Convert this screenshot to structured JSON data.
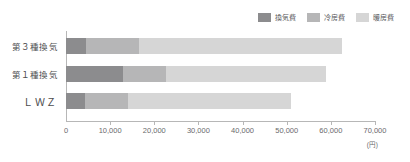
{
  "chart_data": {
    "type": "bar",
    "orientation": "horizontal",
    "stacked": true,
    "title": "",
    "xlabel": "(円)",
    "ylabel": "",
    "xlim": [
      0,
      70000
    ],
    "grid": false,
    "legend_position": "top-right",
    "categories": [
      "第３種換気",
      "第１種換気",
      "ＬＷＺ"
    ],
    "tick_labels": [
      "0",
      "10,000",
      "20,000",
      "30,000",
      "40,000",
      "50,000",
      "60,000",
      "70,000"
    ],
    "tick_values": [
      0,
      10000,
      20000,
      30000,
      40000,
      50000,
      60000,
      70000
    ],
    "series": [
      {
        "name": "換気費",
        "color": "#8c8c8e",
        "values": [
          4500,
          13000,
          4300
        ]
      },
      {
        "name": "冷房費",
        "color": "#b6b6b7",
        "values": [
          12000,
          9700,
          9800
        ]
      },
      {
        "name": "暖房費",
        "color": "#d6d6d6",
        "values": [
          46000,
          36300,
          36900
        ]
      }
    ],
    "totals": [
      62500,
      59000,
      51000
    ]
  },
  "axis": {
    "unit": "(円)",
    "line_color": "#b7b7b7"
  }
}
